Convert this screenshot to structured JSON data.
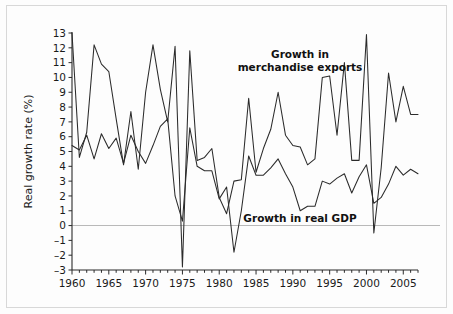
{
  "figure": {
    "background_color": "#fdfdfd",
    "border_color": "#d8d8d8",
    "line_color": "#2b2b2b",
    "zero_line_color": "#b9b9b9"
  },
  "annotations": {
    "exports_line1": "Growth in",
    "exports_line2": "merchandise exports",
    "gdp": "Growth in real GDP"
  },
  "chart_data": {
    "type": "line",
    "title": "",
    "subtitle": "",
    "xlabel": "",
    "ylabel": "Real growth rate (%)",
    "xlim": [
      1960,
      2007
    ],
    "ylim": [
      -3,
      13
    ],
    "ytick_labels": [
      "13",
      "12",
      "11",
      "10",
      "9",
      "8",
      "7",
      "6",
      "5",
      "4",
      "3",
      "2",
      "1",
      "0",
      "-1",
      "-2",
      "-3"
    ],
    "yticks": [
      13,
      12,
      11,
      10,
      9,
      8,
      7,
      6,
      5,
      4,
      3,
      2,
      1,
      0,
      -1,
      -2,
      -3
    ],
    "xtick_labels": [
      "1960",
      "1965",
      "1970",
      "1975",
      "1980",
      "1985",
      "1990",
      "1995",
      "2000",
      "2005"
    ],
    "xticks": [
      1960,
      1965,
      1970,
      1975,
      1980,
      1985,
      1990,
      1995,
      2000,
      2005
    ],
    "xtick_minor_step": 1,
    "grid": false,
    "legend_position": "inline-annotation",
    "zero_reference_line": 0,
    "x": [
      1960,
      1961,
      1962,
      1963,
      1964,
      1965,
      1966,
      1967,
      1968,
      1969,
      1970,
      1971,
      1972,
      1973,
      1974,
      1975,
      1976,
      1977,
      1978,
      1979,
      1980,
      1981,
      1982,
      1983,
      1984,
      1985,
      1986,
      1987,
      1988,
      1989,
      1990,
      1991,
      1992,
      1993,
      1994,
      1995,
      1996,
      1997,
      1998,
      1999,
      2000,
      2001,
      2002,
      2003,
      2004,
      2005,
      2006,
      2007
    ],
    "series": [
      {
        "name": "Growth in merchandise exports",
        "values": [
          13.0,
          4.6,
          6.3,
          12.2,
          10.9,
          10.4,
          7.2,
          4.1,
          7.7,
          3.8,
          9.0,
          12.2,
          9.2,
          7.0,
          12.1,
          -2.8,
          11.8,
          4.4,
          4.6,
          5.2,
          1.9,
          0.8,
          3.0,
          3.1,
          8.6,
          3.6,
          5.2,
          6.5,
          9.0,
          6.1,
          5.4,
          5.3,
          4.1,
          4.5,
          10.0,
          10.1,
          6.1,
          11.0,
          4.4,
          4.4,
          12.9,
          -0.5,
          3.9,
          10.3,
          7.0,
          9.4,
          7.5,
          7.5
        ]
      },
      {
        "name": "Growth in real GDP",
        "values": [
          5.4,
          5.1,
          6.1,
          4.5,
          6.2,
          5.2,
          5.9,
          4.2,
          6.1,
          5.0,
          4.2,
          5.4,
          6.7,
          7.2,
          2.0,
          0.3,
          6.6,
          4.0,
          3.7,
          3.7,
          1.8,
          2.6,
          -1.8,
          1.0,
          4.7,
          3.4,
          3.4,
          3.9,
          4.5,
          3.5,
          2.6,
          1.0,
          1.3,
          1.3,
          3.0,
          2.8,
          3.2,
          3.5,
          2.2,
          3.3,
          4.1,
          1.5,
          1.9,
          2.8,
          4.0,
          3.4,
          3.8,
          3.5
        ]
      }
    ]
  }
}
